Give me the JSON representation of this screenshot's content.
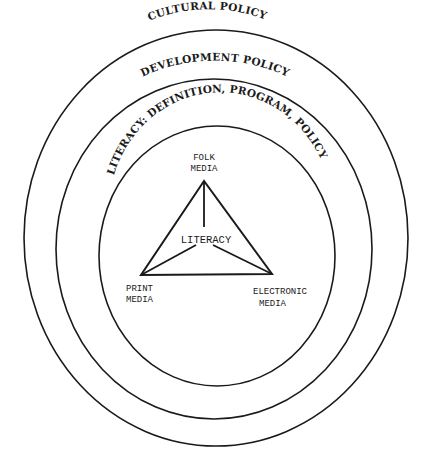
{
  "diagram": {
    "type": "nested-ellipses-with-triangle",
    "rings": [
      {
        "id": "outer",
        "label": "CULTURAL POLICY"
      },
      {
        "id": "middle",
        "label": "DEVELOPMENT POLICY"
      },
      {
        "id": "inner",
        "label": "LITERACY: DEFINITION, PROGRAM, POLICY"
      }
    ],
    "triangle": {
      "center_label": "LITERACY",
      "vertices": [
        {
          "position": "top",
          "line1": "FOLK",
          "line2": "MEDIA"
        },
        {
          "position": "bottom-left",
          "line1": "PRINT",
          "line2": "MEDIA"
        },
        {
          "position": "bottom-right",
          "line1": "ELECTRONIC",
          "line2": "MEDIA"
        }
      ]
    },
    "colors": {
      "ink": "#1a1a1a",
      "background": "#ffffff"
    }
  }
}
